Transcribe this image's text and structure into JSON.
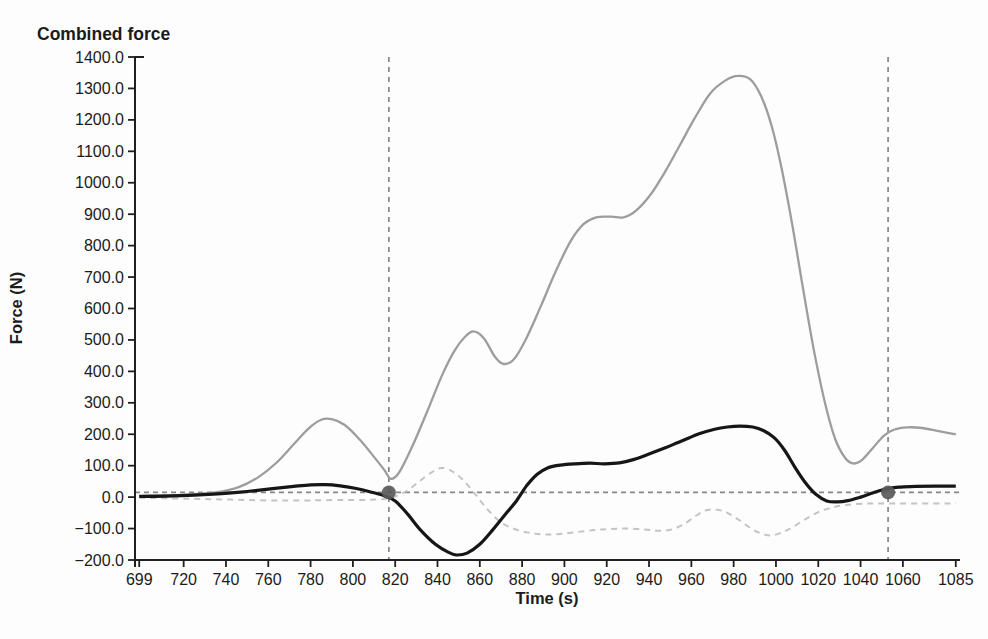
{
  "chart_data": {
    "type": "line",
    "title": "Combined force",
    "xlabel": "Time (s)",
    "ylabel": "Force (N)",
    "xlim": [
      697,
      1087
    ],
    "ylim": [
      -200,
      1400
    ],
    "grid": false,
    "legend": null,
    "x_ticks": [
      699,
      720,
      740,
      760,
      780,
      800,
      820,
      840,
      860,
      880,
      900,
      920,
      940,
      960,
      980,
      1000,
      1020,
      1040,
      1060,
      1085
    ],
    "x_tick_labels": [
      "699",
      "720",
      "740",
      "760",
      "780",
      "800",
      "820",
      "840",
      "860",
      "880",
      "900",
      "920",
      "940",
      "960",
      "980",
      "1000",
      "1020",
      "1040",
      "1060",
      "1085"
    ],
    "y_ticks": [
      1400,
      1300,
      1200,
      1100,
      1000,
      900,
      800,
      700,
      600,
      500,
      400,
      300,
      200,
      100,
      0,
      -100,
      -200
    ],
    "y_tick_labels": [
      "1400.0",
      "1300.0",
      "1200.0",
      "1100.0",
      "1000.0",
      "900.0",
      "800.0",
      "700.0",
      "600.0",
      "500.0",
      "400.0",
      "300.0",
      "200.0",
      "100.0",
      "0.0",
      "−100.0",
      "−200.0"
    ],
    "axis_color": "#1f1f1f",
    "series": [
      {
        "name": "light-dashed-component",
        "style": "dashed",
        "color": "#c4c4c4",
        "width": 2,
        "dash": "6 5",
        "points": [
          [
            699,
            -2
          ],
          [
            714,
            -4
          ],
          [
            728,
            -6
          ],
          [
            742,
            -8
          ],
          [
            756,
            -10
          ],
          [
            770,
            -11
          ],
          [
            783,
            -10
          ],
          [
            795,
            -9
          ],
          [
            805,
            -9
          ],
          [
            813,
            -7
          ],
          [
            819,
            0
          ],
          [
            825,
            18
          ],
          [
            831,
            48
          ],
          [
            837,
            78
          ],
          [
            842,
            93
          ],
          [
            847,
            82
          ],
          [
            852,
            55
          ],
          [
            858,
            8
          ],
          [
            864,
            -42
          ],
          [
            870,
            -80
          ],
          [
            877,
            -103
          ],
          [
            884,
            -114
          ],
          [
            891,
            -119
          ],
          [
            898,
            -117
          ],
          [
            906,
            -111
          ],
          [
            914,
            -105
          ],
          [
            922,
            -101
          ],
          [
            930,
            -100
          ],
          [
            938,
            -103
          ],
          [
            944,
            -107
          ],
          [
            950,
            -104
          ],
          [
            956,
            -88
          ],
          [
            962,
            -60
          ],
          [
            967,
            -42
          ],
          [
            972,
            -40
          ],
          [
            977,
            -50
          ],
          [
            983,
            -75
          ],
          [
            989,
            -103
          ],
          [
            994,
            -118
          ],
          [
            998,
            -122
          ],
          [
            1003,
            -112
          ],
          [
            1008,
            -95
          ],
          [
            1014,
            -70
          ],
          [
            1020,
            -48
          ],
          [
            1026,
            -34
          ],
          [
            1033,
            -25
          ],
          [
            1041,
            -21
          ],
          [
            1050,
            -20
          ],
          [
            1065,
            -20
          ],
          [
            1085,
            -20
          ]
        ]
      },
      {
        "name": "gray-total-force",
        "style": "solid",
        "color": "#9d9d9d",
        "width": 2.3,
        "dash": "",
        "points": [
          [
            699,
            5
          ],
          [
            712,
            6
          ],
          [
            724,
            9
          ],
          [
            736,
            16
          ],
          [
            746,
            32
          ],
          [
            755,
            62
          ],
          [
            764,
            110
          ],
          [
            772,
            168
          ],
          [
            779,
            218
          ],
          [
            785,
            246
          ],
          [
            790,
            248
          ],
          [
            796,
            230
          ],
          [
            803,
            185
          ],
          [
            810,
            128
          ],
          [
            815,
            85
          ],
          [
            818,
            58
          ],
          [
            822,
            80
          ],
          [
            828,
            160
          ],
          [
            835,
            270
          ],
          [
            842,
            385
          ],
          [
            848,
            465
          ],
          [
            853,
            510
          ],
          [
            857,
            527
          ],
          [
            862,
            505
          ],
          [
            867,
            448
          ],
          [
            871,
            424
          ],
          [
            876,
            438
          ],
          [
            882,
            505
          ],
          [
            889,
            610
          ],
          [
            896,
            720
          ],
          [
            903,
            815
          ],
          [
            909,
            868
          ],
          [
            915,
            890
          ],
          [
            922,
            892
          ],
          [
            928,
            890
          ],
          [
            934,
            912
          ],
          [
            941,
            965
          ],
          [
            948,
            1040
          ],
          [
            955,
            1125
          ],
          [
            962,
            1210
          ],
          [
            969,
            1285
          ],
          [
            976,
            1325
          ],
          [
            982,
            1340
          ],
          [
            988,
            1328
          ],
          [
            993,
            1275
          ],
          [
            998,
            1180
          ],
          [
            1003,
            1035
          ],
          [
            1008,
            855
          ],
          [
            1013,
            655
          ],
          [
            1018,
            465
          ],
          [
            1023,
            305
          ],
          [
            1028,
            185
          ],
          [
            1033,
            122
          ],
          [
            1037,
            107
          ],
          [
            1041,
            120
          ],
          [
            1046,
            158
          ],
          [
            1051,
            195
          ],
          [
            1056,
            215
          ],
          [
            1062,
            222
          ],
          [
            1069,
            220
          ],
          [
            1077,
            210
          ],
          [
            1085,
            200
          ]
        ]
      },
      {
        "name": "black-component",
        "style": "solid",
        "color": "#161616",
        "width": 3.2,
        "dash": "",
        "points": [
          [
            699,
            2
          ],
          [
            712,
            3
          ],
          [
            725,
            6
          ],
          [
            738,
            11
          ],
          [
            750,
            18
          ],
          [
            762,
            27
          ],
          [
            772,
            34
          ],
          [
            780,
            39
          ],
          [
            787,
            40
          ],
          [
            794,
            36
          ],
          [
            801,
            28
          ],
          [
            808,
            17
          ],
          [
            815,
            4
          ],
          [
            820,
            -12
          ],
          [
            826,
            -55
          ],
          [
            832,
            -105
          ],
          [
            839,
            -150
          ],
          [
            845,
            -175
          ],
          [
            849,
            -184
          ],
          [
            854,
            -178
          ],
          [
            860,
            -150
          ],
          [
            866,
            -105
          ],
          [
            872,
            -55
          ],
          [
            877,
            -15
          ],
          [
            882,
            35
          ],
          [
            887,
            72
          ],
          [
            892,
            93
          ],
          [
            898,
            102
          ],
          [
            905,
            106
          ],
          [
            912,
            108
          ],
          [
            919,
            106
          ],
          [
            926,
            109
          ],
          [
            933,
            120
          ],
          [
            940,
            137
          ],
          [
            948,
            158
          ],
          [
            956,
            180
          ],
          [
            964,
            202
          ],
          [
            971,
            216
          ],
          [
            977,
            223
          ],
          [
            983,
            226
          ],
          [
            989,
            223
          ],
          [
            994,
            212
          ],
          [
            999,
            190
          ],
          [
            1004,
            150
          ],
          [
            1009,
            95
          ],
          [
            1014,
            45
          ],
          [
            1019,
            8
          ],
          [
            1024,
            -12
          ],
          [
            1029,
            -15
          ],
          [
            1034,
            -11
          ],
          [
            1040,
            0
          ],
          [
            1046,
            14
          ],
          [
            1052,
            26
          ],
          [
            1058,
            32
          ],
          [
            1066,
            34
          ],
          [
            1075,
            35
          ],
          [
            1085,
            35
          ]
        ]
      }
    ],
    "reference_line": {
      "y": 15,
      "color": "#868686",
      "dash": "5 4",
      "width": 1.6
    },
    "vertical_markers": [
      {
        "x": 817,
        "color": "#7f7f7f",
        "dash": "5 5",
        "width": 1.6
      },
      {
        "x": 1053,
        "color": "#7f7f7f",
        "dash": "5 5",
        "width": 1.6
      }
    ],
    "marker_points": [
      {
        "x": 817,
        "y": 15
      },
      {
        "x": 1053,
        "y": 15
      }
    ],
    "marker_color": "#5a5a5a",
    "marker_radius": 7
  }
}
